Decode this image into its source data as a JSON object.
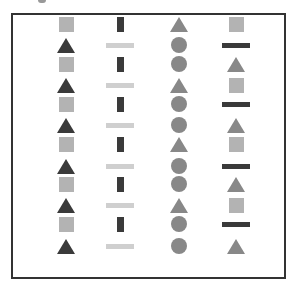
{
  "figure": {
    "frame_color": "#333333",
    "colors": {
      "light_gray": "#b3b3b3",
      "mid_gray": "#888888",
      "dark_gray": "#3a3a3a",
      "pale_gray": "#cfcfcf"
    },
    "row_y": [
      22,
      43,
      62,
      83,
      102,
      123,
      142,
      164,
      182,
      203,
      222,
      244
    ],
    "columns": [
      {
        "x": 46,
        "shapes": [
          "square",
          "triangle",
          "square",
          "triangle",
          "square",
          "triangle",
          "square",
          "triangle",
          "square",
          "triangle",
          "square",
          "triangle"
        ],
        "colors": [
          "light_gray",
          "dark_gray",
          "light_gray",
          "dark_gray",
          "light_gray",
          "dark_gray",
          "light_gray",
          "dark_gray",
          "light_gray",
          "dark_gray",
          "light_gray",
          "dark_gray"
        ]
      },
      {
        "x": 100,
        "shapes": [
          "vbar",
          "hbar",
          "vbar",
          "hbar",
          "vbar",
          "hbar",
          "vbar",
          "hbar",
          "vbar",
          "hbar",
          "vbar",
          "hbar"
        ],
        "colors": [
          "dark_gray",
          "pale_gray",
          "dark_gray",
          "pale_gray",
          "dark_gray",
          "pale_gray",
          "dark_gray",
          "pale_gray",
          "dark_gray",
          "pale_gray",
          "dark_gray",
          "pale_gray"
        ]
      },
      {
        "x": 159,
        "shapes": [
          "triangle",
          "circle",
          "circle",
          "triangle",
          "circle",
          "circle",
          "triangle",
          "circle",
          "circle",
          "triangle",
          "circle",
          "circle"
        ],
        "colors": [
          "mid_gray",
          "mid_gray",
          "mid_gray",
          "mid_gray",
          "mid_gray",
          "mid_gray",
          "mid_gray",
          "mid_gray",
          "mid_gray",
          "mid_gray",
          "mid_gray",
          "mid_gray"
        ]
      },
      {
        "x": 216,
        "shapes": [
          "square",
          "hbar",
          "triangle",
          "square",
          "hbar",
          "triangle",
          "square",
          "hbar",
          "triangle",
          "square",
          "hbar",
          "triangle"
        ],
        "colors": [
          "light_gray",
          "dark_gray",
          "mid_gray",
          "light_gray",
          "dark_gray",
          "mid_gray",
          "light_gray",
          "dark_gray",
          "mid_gray",
          "light_gray",
          "dark_gray",
          "mid_gray"
        ]
      }
    ]
  }
}
